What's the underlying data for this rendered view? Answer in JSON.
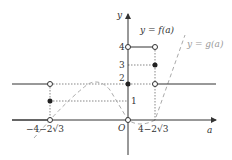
{
  "diagram": {
    "axes": {
      "x_label": "a",
      "y_label": "y",
      "origin_label": "O",
      "color": "#333333"
    },
    "y_ticks": [
      {
        "value": 4,
        "label": "4"
      },
      {
        "value": 3,
        "label": "3"
      },
      {
        "value": 2,
        "label": "2"
      },
      {
        "value": 1,
        "label": "1"
      }
    ],
    "x_ticks": [
      {
        "label": "−4−2√3"
      },
      {
        "label": "4−2√3"
      }
    ],
    "curves": [
      {
        "label": "y = f(a)",
        "style": "solid",
        "color": "#333333"
      },
      {
        "label": "y = g(a)",
        "style": "dashed",
        "color": "#aaaaaa"
      }
    ],
    "points": {
      "filled": [
        {
          "a": "−4−2√3",
          "y": 1
        },
        {
          "a": "0",
          "y": 2
        },
        {
          "a": "4−2√3",
          "y": 3
        }
      ],
      "open": [
        {
          "a": "−4−2√3",
          "y": 2
        },
        {
          "a": "−4−2√3",
          "y": 0
        },
        {
          "a": "0",
          "y": 4
        },
        {
          "a": "0",
          "y": 0
        },
        {
          "a": "4−2√3",
          "y": 4
        },
        {
          "a": "4−2√3",
          "y": 2
        }
      ]
    }
  }
}
